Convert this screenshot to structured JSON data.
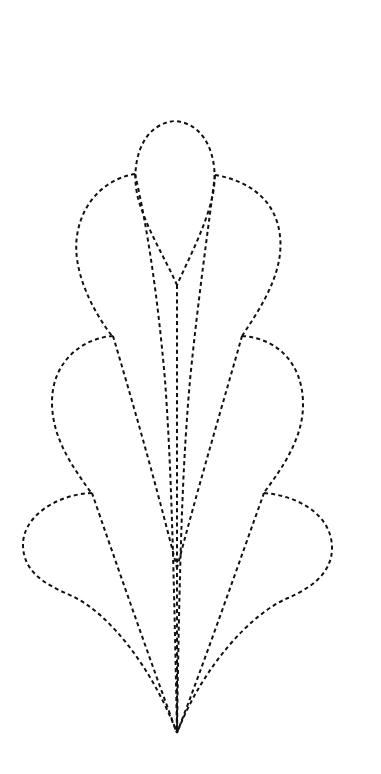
{
  "figure": {
    "title": "Dashed-outline leaf/feather stencil pattern",
    "background": "#ffffff",
    "stroke_color": "#111111",
    "stroke_style": "dashed",
    "width": 381,
    "height": 774
  },
  "shapes": {
    "top_teardrop": {
      "label": "Top teardrop petal",
      "d": "M177,285 C165,258 146,228 138,198 C130,166 140,124 175,121 C210,124 220,166 212,198 C205,228 189,258 177,285"
    },
    "upper_left_lobe": {
      "label": "Upper left lobe",
      "d": "M135,174 C108,178 82,200 77,236 C72,270 92,310 112,336"
    },
    "upper_right_lobe": {
      "label": "Upper right lobe",
      "d": "M215,175 C246,180 276,198 280,236 C284,272 262,306 242,336"
    },
    "middle_left_lobe": {
      "label": "Middle left lobe",
      "d": "M113,336 C82,338 52,362 52,402 C52,438 72,466 92,494"
    },
    "middle_right_lobe": {
      "label": "Middle right lobe",
      "d": "M242,336 C276,338 302,362 303,402 C304,436 284,466 263,494"
    },
    "lower_left_lobe": {
      "label": "Lower left lobe",
      "d": "M92,493 C58,494 22,516 23,546 C24,572 44,584 72,596 C110,614 152,668 177,733"
    },
    "lower_right_lobe": {
      "label": "Lower right lobe",
      "d": "M264,493 C300,496 332,516 332,548 C332,576 306,590 288,598 C250,614 202,668 177,733"
    },
    "left_outer_stroke": {
      "label": "Left outer vein",
      "d": "M135,174 C148,230 158,300 165,380 C170,450 173,520 177,733"
    },
    "right_outer_stroke": {
      "label": "Right outer vein",
      "d": "M215,175 C208,230 198,300 190,380 C184,450 180,520 177,733"
    },
    "left_middle_vein": {
      "label": "Left middle vein",
      "d": "M113,336 C132,400 155,480 177,568"
    },
    "right_middle_vein": {
      "label": "Right middle vein",
      "d": "M242,336 C224,400 200,480 177,568"
    },
    "left_lower_vein": {
      "label": "Left lower vein",
      "d": "M92,493 C115,560 150,660 177,733"
    },
    "right_lower_vein": {
      "label": "Right lower vein",
      "d": "M264,493 C240,560 205,660 177,733"
    },
    "center_stem": {
      "label": "Center stem",
      "d": "M177,285 L177,733"
    }
  },
  "key_points": {
    "top_tip": [
      175,
      121
    ],
    "teardrop_base": [
      177,
      285
    ],
    "inner_convergence": [
      177,
      568
    ],
    "bottom_point": [
      177,
      733
    ]
  }
}
